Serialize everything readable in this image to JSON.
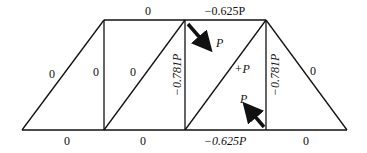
{
  "diagram": {
    "type": "truss-member-forces",
    "members": {
      "top_left": "0",
      "top_right": "−0.625P",
      "left_diagonal": "0",
      "vertical_1": "0",
      "diagonal_2": "0",
      "vertical_2": "−0.781P",
      "diagonal_3": "+P",
      "vertical_3": "−0.781P",
      "right_diagonal": "0",
      "bottom_1": "0",
      "bottom_2": "0",
      "bottom_3": "−0.625P",
      "bottom_4": "0"
    },
    "loads": {
      "top_load": "P",
      "bottom_load": "P"
    },
    "colors": {
      "line": "#111111",
      "background": "#ffffff"
    }
  }
}
